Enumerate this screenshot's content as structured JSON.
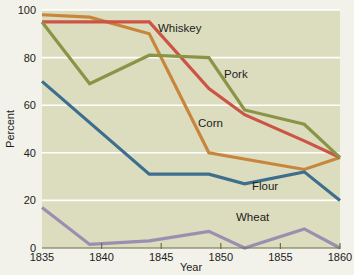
{
  "chart_data": {
    "type": "line",
    "title": "",
    "xlabel": "Year",
    "ylabel": "Percent",
    "xlim": [
      1835,
      1860
    ],
    "ylim": [
      0,
      100
    ],
    "grid": true,
    "legend_position": "inline-labels",
    "xticks": [
      "1835",
      "1840",
      "1845",
      "1850",
      "1855",
      "1860"
    ],
    "xtick_values": [
      1835,
      1840,
      1845,
      1850,
      1855,
      1860
    ],
    "yticks": [
      "0",
      "20",
      "40",
      "60",
      "80",
      "100"
    ],
    "ytick_values": [
      0,
      20,
      40,
      60,
      80,
      100
    ],
    "series": [
      {
        "name": "Corn",
        "color": "#c8863c",
        "label": "Corn",
        "x": [
          1835,
          1839,
          1844,
          1849,
          1857,
          1860
        ],
        "values": [
          98,
          97,
          90,
          40,
          33,
          38
        ]
      },
      {
        "name": "Whiskey",
        "color": "#cc5444",
        "label": "Whiskey",
        "x": [
          1835,
          1839,
          1844,
          1849,
          1852,
          1857,
          1860
        ],
        "values": [
          95,
          95,
          95,
          67,
          56,
          45,
          38
        ]
      },
      {
        "name": "Pork",
        "color": "#8a9447",
        "label": "Pork",
        "x": [
          1835,
          1839,
          1844,
          1849,
          1852,
          1857,
          1860
        ],
        "values": [
          95,
          69,
          81,
          80,
          58,
          52,
          38
        ]
      },
      {
        "name": "Flour",
        "color": "#3d6e8e",
        "label": "Flour",
        "x": [
          1835,
          1844,
          1849,
          1852,
          1857,
          1860
        ],
        "values": [
          70,
          31,
          31,
          27,
          32,
          20
        ]
      },
      {
        "name": "Wheat",
        "color": "#9a8fb0",
        "label": "Wheat",
        "x": [
          1835,
          1839,
          1844,
          1849,
          1852,
          1857,
          1860
        ],
        "values": [
          17,
          1.5,
          3,
          7,
          0,
          8,
          0
        ]
      }
    ],
    "series_label_positions": [
      {
        "name": "Whiskey",
        "x": 158,
        "y": 32
      },
      {
        "name": "Pork",
        "x": 224,
        "y": 78
      },
      {
        "name": "Corn",
        "x": 198,
        "y": 127
      },
      {
        "name": "Flour",
        "x": 252,
        "y": 190
      },
      {
        "name": "Wheat",
        "x": 236,
        "y": 221
      }
    ],
    "colors": {
      "background": "#f2f1ea",
      "plot_background": "#dcdcbe",
      "gridlines": "#ffffff",
      "axis": "#6b6f4a",
      "text": "#1d1d1b"
    }
  }
}
